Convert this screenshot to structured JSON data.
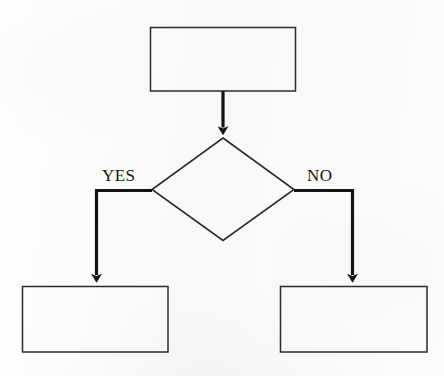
{
  "diagram": {
    "type": "flowchart",
    "orientation": "top-down",
    "background_color": "#fafafa",
    "stroke_color": "#1a1a1a",
    "nodes": [
      {
        "id": "process-top",
        "shape": "rectangle",
        "text": "",
        "x": 150,
        "y": 27,
        "width": 146,
        "height": 64
      },
      {
        "id": "decision",
        "shape": "diamond",
        "text": "",
        "cx": 223,
        "cy": 189,
        "rx": 71,
        "ry": 51
      },
      {
        "id": "outcome-yes",
        "shape": "rectangle",
        "text": "",
        "x": 22,
        "y": 286,
        "width": 146,
        "height": 66
      },
      {
        "id": "outcome-no",
        "shape": "rectangle",
        "text": "",
        "x": 280,
        "y": 286,
        "width": 147,
        "height": 66
      }
    ],
    "edges": [
      {
        "id": "edge-top-to-decision",
        "from": "process-top",
        "to": "decision",
        "label": "",
        "arrowhead": true
      },
      {
        "id": "edge-decision-yes",
        "from": "decision",
        "to": "outcome-yes",
        "label": "YES",
        "arrowhead": true
      },
      {
        "id": "edge-decision-no",
        "from": "decision",
        "to": "outcome-no",
        "label": "NO",
        "arrowhead": true
      }
    ],
    "labels": {
      "yes": "YES",
      "no": "NO"
    }
  }
}
